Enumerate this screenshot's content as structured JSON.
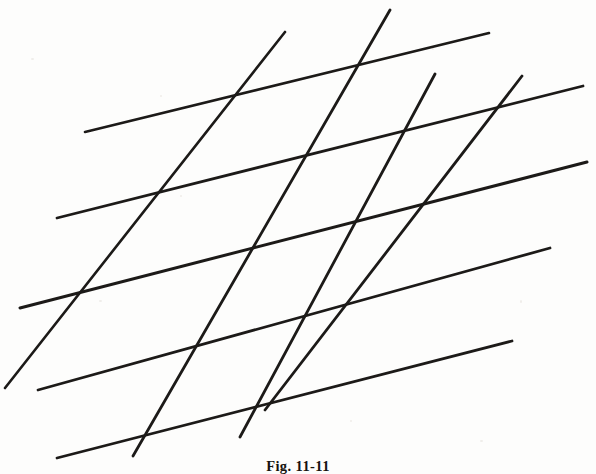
{
  "figure": {
    "caption": "Fig. 11-11",
    "background_color": "#fdfdfc",
    "ink_color": "#1c1a18",
    "canvas": {
      "width": 596,
      "height": 474
    }
  },
  "chart_data": {
    "type": "line",
    "title": "Fig. 11-11",
    "subtitle": "",
    "xlabel": "",
    "ylabel": "",
    "grid": false,
    "legend": "none",
    "xlim": [
      0,
      596
    ],
    "ylim": [
      0,
      474
    ],
    "series": [
      {
        "name": "shallow-line-1",
        "family": "shallow",
        "x": [
          85,
          489
        ],
        "y": [
          132,
          33
        ],
        "stroke_width": 2.6
      },
      {
        "name": "shallow-line-2",
        "family": "shallow",
        "x": [
          57,
          583
        ],
        "y": [
          218,
          86
        ],
        "stroke_width": 2.8
      },
      {
        "name": "shallow-line-3",
        "family": "shallow",
        "x": [
          20,
          587
        ],
        "y": [
          308,
          162
        ],
        "stroke_width": 3.0
      },
      {
        "name": "shallow-line-4",
        "family": "shallow",
        "x": [
          38,
          550
        ],
        "y": [
          390,
          248
        ],
        "stroke_width": 2.8
      },
      {
        "name": "shallow-line-5",
        "family": "shallow",
        "x": [
          57,
          512
        ],
        "y": [
          458,
          341
        ],
        "stroke_width": 2.8
      },
      {
        "name": "steep-line-1",
        "family": "steep",
        "x": [
          5,
          285
        ],
        "y": [
          388,
          32
        ],
        "stroke_width": 2.6
      },
      {
        "name": "steep-line-2",
        "family": "steep",
        "x": [
          133,
          390
        ],
        "y": [
          456,
          10
        ],
        "stroke_width": 2.8
      },
      {
        "name": "steep-line-3",
        "family": "steep",
        "x": [
          240,
          435
        ],
        "y": [
          437,
          74
        ],
        "stroke_width": 2.8
      },
      {
        "name": "steep-line-4",
        "family": "steep",
        "x": [
          265,
          522
        ],
        "y": [
          410,
          76
        ],
        "stroke_width": 2.8
      }
    ]
  }
}
